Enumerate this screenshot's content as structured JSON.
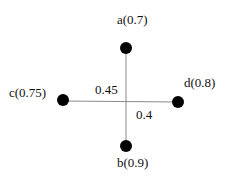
{
  "nodes": [
    {
      "id": "a",
      "label": "a(0.7)",
      "x": 126,
      "y": 48
    },
    {
      "id": "b",
      "label": "b(0.9)",
      "x": 126,
      "y": 146
    },
    {
      "id": "c",
      "label": "c(0.75)",
      "x": 63,
      "y": 100
    },
    {
      "id": "d",
      "label": "d(0.8)",
      "x": 178,
      "y": 102
    }
  ],
  "edges": [
    {
      "from": "a",
      "to": "b",
      "label": "0.45"
    },
    {
      "from": "c",
      "to": "d",
      "label": "0.4"
    }
  ],
  "colors": {
    "node": "#000000",
    "edge": "#8a8a8a",
    "text": "#111111"
  }
}
